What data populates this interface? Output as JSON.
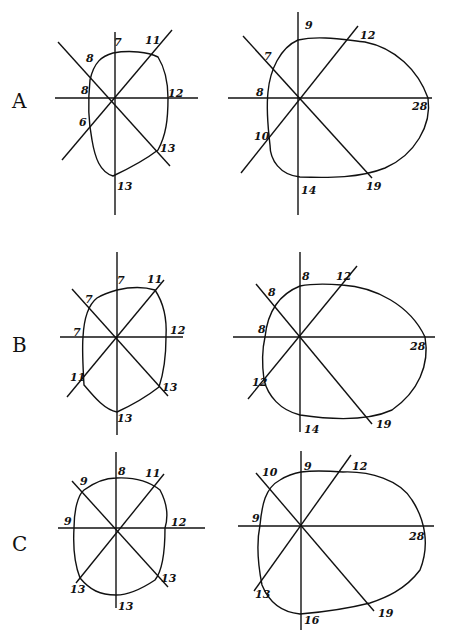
{
  "rows": [
    {
      "label": "A",
      "label_pos": [
        12,
        108
      ],
      "left": {
        "center": [
          115,
          98
        ],
        "labels": {
          "n": "7",
          "ne": "11",
          "e": "12",
          "se": "13",
          "s": "13",
          "sw": "6",
          "w": "8",
          "nw": "8"
        },
        "label_pos": {
          "n": [
            115,
            46
          ],
          "ne": [
            147,
            43
          ],
          "e": [
            172,
            96
          ],
          "se": [
            162,
            152
          ],
          "s": [
            118,
            190
          ],
          "sw": [
            79,
            124
          ],
          "w": [
            88,
            96
          ],
          "nw": [
            88,
            56
          ]
        }
      },
      "right": {
        "center": [
          299,
          98
        ],
        "labels": {
          "n": "9",
          "ne": "12",
          "e": "28",
          "se": "19",
          "s": "14",
          "sw": "10",
          "w": "8",
          "nw": "7"
        },
        "label_pos": {
          "n": [
            305,
            27
          ],
          "ne": [
            362,
            38
          ],
          "e": [
            416,
            110
          ],
          "se": [
            368,
            188
          ],
          "s": [
            302,
            192
          ],
          "sw": [
            255,
            137
          ],
          "w": [
            256,
            96
          ],
          "nw": [
            264,
            58
          ]
        }
      }
    },
    {
      "label": "B",
      "label_pos": [
        12,
        352
      ],
      "left": {
        "center": [
          117,
          337
        ],
        "labels": {
          "n": "7",
          "ne": "11",
          "e": "12",
          "se": "13",
          "s": "13",
          "sw": "11",
          "w": "7",
          "nw": "7"
        },
        "label_pos": {
          "n": [
            117,
            284
          ],
          "ne": [
            148,
            282
          ],
          "e": [
            172,
            334
          ],
          "se": [
            163,
            390
          ],
          "s": [
            117,
            422
          ],
          "sw": [
            73,
            382
          ],
          "w": [
            73,
            337
          ],
          "nw": [
            84,
            310
          ]
        }
      },
      "right": {
        "center": [
          300,
          337
        ],
        "labels": {
          "n": "8",
          "ne": "12",
          "e": "28",
          "se": "19",
          "s": "14",
          "sw": "12",
          "w": "8",
          "nw": "8"
        },
        "label_pos": {
          "n": [
            303,
            278
          ],
          "ne": [
            336,
            279
          ],
          "e": [
            413,
            350
          ],
          "se": [
            378,
            427
          ],
          "s": [
            305,
            432
          ],
          "sw": [
            253,
            385
          ],
          "w": [
            258,
            333
          ],
          "nw": [
            268,
            296
          ]
        }
      }
    },
    {
      "label": "C",
      "label_pos": [
        12,
        550
      ],
      "left": {
        "center": [
          116,
          528
        ],
        "labels": {
          "n": "8",
          "ne": "11",
          "e": "12",
          "se": "13",
          "s": "13",
          "sw": "13",
          "w": "9",
          "nw": "9"
        },
        "label_pos": {
          "n": [
            118,
            475
          ],
          "ne": [
            149,
            476
          ],
          "e": [
            173,
            526
          ],
          "se": [
            162,
            582
          ],
          "s": [
            118,
            610
          ],
          "sw": [
            72,
            593
          ],
          "w": [
            65,
            525
          ],
          "nw": [
            80,
            487
          ]
        }
      },
      "right": {
        "center": [
          301,
          526
        ],
        "labels": {
          "n": "9",
          "ne": "12",
          "e": "28",
          "se": "19",
          "s": "16",
          "sw": "13",
          "w": "9",
          "nw": "10"
        },
        "label_pos": {
          "n": [
            305,
            469
          ],
          "ne": [
            354,
            469
          ],
          "e": [
            412,
            540
          ],
          "se": [
            380,
            617
          ],
          "s": [
            304,
            623
          ],
          "sw": [
            258,
            597
          ],
          "w": [
            252,
            522
          ],
          "nw": [
            262,
            477
          ]
        }
      }
    }
  ]
}
